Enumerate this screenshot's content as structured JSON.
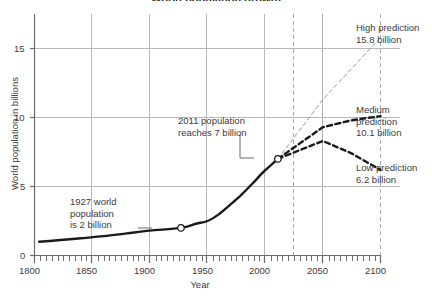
{
  "chart_data": {
    "type": "line",
    "title": "World population growth",
    "xlabel": "Year",
    "ylabel": "World population in billions",
    "xlim": [
      1800,
      2100
    ],
    "ylim": [
      0,
      17
    ],
    "xticks": [
      1800,
      1850,
      1900,
      1950,
      2000,
      2050,
      2100
    ],
    "xtick_labels": [
      "1800",
      "1850",
      "1900",
      "1950",
      "2000",
      "2050",
      "2100"
    ],
    "yticks": [
      0,
      5,
      10,
      15
    ],
    "ytick_labels": [
      "0",
      "5",
      "10",
      "15"
    ],
    "minor_xtick_step": 5,
    "grid": true,
    "legend": "none",
    "series": [
      {
        "name": "Historical world population",
        "style": "solid-thick",
        "color": "#1a1a1a",
        "points": [
          [
            1804,
            1.0
          ],
          [
            1820,
            1.1
          ],
          [
            1840,
            1.25
          ],
          [
            1860,
            1.4
          ],
          [
            1880,
            1.6
          ],
          [
            1900,
            1.8
          ],
          [
            1927,
            2.0
          ],
          [
            1940,
            2.3
          ],
          [
            1950,
            2.5
          ],
          [
            1960,
            3.0
          ],
          [
            1970,
            3.7
          ],
          [
            1980,
            4.45
          ],
          [
            1990,
            5.3
          ],
          [
            1995,
            5.75
          ],
          [
            1999,
            6.1
          ],
          [
            2005,
            6.55
          ],
          [
            2011,
            7.0
          ]
        ]
      },
      {
        "name": "High prediction",
        "style": "dashed-thin",
        "color": "#9a9a9a",
        "points": [
          [
            2011,
            7.0
          ],
          [
            2050,
            11.3
          ],
          [
            2100,
            15.8
          ]
        ]
      },
      {
        "name": "Medium prediction",
        "style": "dashed-thick",
        "color": "#1a1a1a",
        "points": [
          [
            2011,
            7.0
          ],
          [
            2050,
            9.3
          ],
          [
            2075,
            9.8
          ],
          [
            2100,
            10.1
          ]
        ]
      },
      {
        "name": "Low prediction",
        "style": "dashed-thick",
        "color": "#1a1a1a",
        "points": [
          [
            2011,
            7.0
          ],
          [
            2050,
            8.3
          ],
          [
            2075,
            7.4
          ],
          [
            2100,
            6.2
          ]
        ]
      }
    ],
    "vertical_markers": [
      {
        "x": 2025,
        "style": "dashed",
        "color": "#aaaaaa"
      },
      {
        "x": 2050,
        "style": "dashed",
        "color": "#aaaaaa"
      },
      {
        "x": 2100,
        "style": "dashed",
        "color": "#aaaaaa"
      }
    ],
    "markers": [
      {
        "x": 1927,
        "y": 2.0,
        "shape": "circle-open",
        "label": "1927 world population is 2 billion"
      },
      {
        "x": 2011,
        "y": 7.0,
        "shape": "circle-open",
        "label": "2011 population reaches 7 billion"
      }
    ],
    "annotations": [
      {
        "id": "ann-1927",
        "text": "1927 world\npopulation\nis 2 billion",
        "target_x": 1927,
        "target_y": 2.0
      },
      {
        "id": "ann-2011",
        "text": "2011 population\nreaches 7 billion",
        "target_x": 2011,
        "target_y": 7.0
      }
    ],
    "end_labels": [
      {
        "id": "high",
        "text": "High prediction\n15.8 billion",
        "value": 15.8,
        "at_x": 2100
      },
      {
        "id": "medium",
        "text": "Medium\nprediction\n10.1 billion",
        "value": 10.1,
        "at_x": 2100
      },
      {
        "id": "low",
        "text": "Low prediction\n6.2 billion",
        "value": 6.2,
        "at_x": 2100
      }
    ]
  },
  "axis": {
    "x_title": "Year",
    "y_title": "World population in billions",
    "x_tick_0": "1800",
    "x_tick_1": "1850",
    "x_tick_2": "1900",
    "x_tick_3": "1950",
    "x_tick_4": "2000",
    "x_tick_5": "2050",
    "x_tick_6": "2100",
    "y_tick_0": "0",
    "y_tick_5": "5",
    "y_tick_10": "10",
    "y_tick_15": "15"
  },
  "annotations": {
    "pop_1927": "1927 world\npopulation\nis 2 billion",
    "pop_2011": "2011 population\nreaches 7 billion"
  },
  "predictions": {
    "high": "High prediction\n15.8 billion",
    "medium": "Medium\nprediction\n10.1 billion",
    "low": "Low prediction\n6.2 billion"
  },
  "title": {
    "text": "World population growth"
  },
  "colors": {
    "historical_line": "#1a1a1a",
    "prediction_dark": "#1a1a1a",
    "prediction_light": "#9a9a9a",
    "grid": "#b8b8b8",
    "axis": "#6b6b6b",
    "text": "#3b3b3b",
    "background": "#ffffff"
  }
}
